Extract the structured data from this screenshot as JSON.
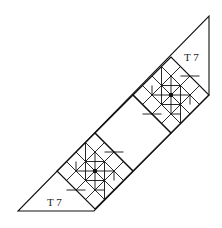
{
  "diagram": {
    "outline_points": [
      [
        18,
        211
      ],
      [
        94,
        211
      ],
      [
        209,
        95
      ],
      [
        209,
        16
      ]
    ],
    "labels": [
      {
        "text": "T 7",
        "x": 184,
        "y": 61
      },
      {
        "text": "T 7",
        "x": 47,
        "y": 206
      }
    ],
    "blocks": [
      {
        "name": "upper-pinwheel-block",
        "cx": 171,
        "cy": 95,
        "r": 38
      },
      {
        "name": "lower-pinwheel-block",
        "cx": 95,
        "cy": 171,
        "r": 38
      }
    ],
    "center_square": {
      "points": [
        [
          133,
          95
        ],
        [
          171,
          133
        ],
        [
          133,
          171
        ],
        [
          95,
          133
        ]
      ]
    },
    "stroke_color": "#111111",
    "background": "#ffffff"
  }
}
